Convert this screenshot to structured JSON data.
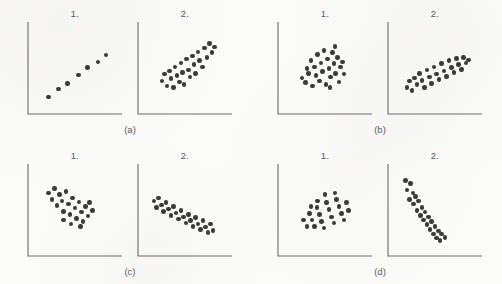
{
  "figure": {
    "type": "scatter-plot-matrix",
    "background_color": "#fbfbfa",
    "dot_color": "#3a3a3a",
    "axis_color": "#6b6b6b",
    "text_color": "#5d5d5d",
    "panel_label_1": "1.",
    "panel_label_2": "2.",
    "captions": {
      "a": "(a)",
      "b": "(b)",
      "c": "(c)",
      "d": "(d)"
    }
  },
  "chart_data": [
    {
      "id": "a1",
      "type": "scatter",
      "title": "1.",
      "group": "(a)",
      "xlabel": "",
      "ylabel": "",
      "xlim": [
        0,
        100
      ],
      "ylim": [
        0,
        100
      ],
      "grid": false,
      "legend": "none",
      "relationship": "strong positive linear",
      "points": [
        [
          18,
          14
        ],
        [
          30,
          24
        ],
        [
          41,
          31
        ],
        [
          54,
          42
        ],
        [
          65,
          51
        ],
        [
          78,
          58
        ],
        [
          88,
          67
        ]
      ]
    },
    {
      "id": "a2",
      "type": "scatter",
      "title": "2.",
      "group": "(a)",
      "xlabel": "",
      "ylabel": "",
      "xlim": [
        0,
        100
      ],
      "ylim": [
        0,
        100
      ],
      "grid": false,
      "legend": "none",
      "relationship": "moderate positive",
      "points": [
        [
          22,
          34
        ],
        [
          25,
          43
        ],
        [
          28,
          28
        ],
        [
          31,
          47
        ],
        [
          33,
          37
        ],
        [
          36,
          26
        ],
        [
          38,
          52
        ],
        [
          40,
          41
        ],
        [
          43,
          33
        ],
        [
          45,
          57
        ],
        [
          47,
          45
        ],
        [
          49,
          30
        ],
        [
          52,
          62
        ],
        [
          54,
          48
        ],
        [
          56,
          39
        ],
        [
          59,
          66
        ],
        [
          61,
          55
        ],
        [
          63,
          44
        ],
        [
          66,
          71
        ],
        [
          68,
          60
        ],
        [
          71,
          52
        ],
        [
          74,
          76
        ],
        [
          77,
          64
        ],
        [
          80,
          82
        ],
        [
          83,
          70
        ],
        [
          86,
          77
        ]
      ]
    },
    {
      "id": "b1",
      "type": "scatter",
      "title": "1.",
      "group": "(b)",
      "xlabel": "",
      "ylabel": "",
      "xlim": [
        0,
        100
      ],
      "ylim": [
        0,
        100
      ],
      "grid": false,
      "legend": "none",
      "relationship": "no correlation (round cloud)",
      "points": [
        [
          22,
          38
        ],
        [
          26,
          32
        ],
        [
          28,
          50
        ],
        [
          30,
          44
        ],
        [
          33,
          60
        ],
        [
          35,
          28
        ],
        [
          37,
          52
        ],
        [
          39,
          41
        ],
        [
          41,
          68
        ],
        [
          43,
          34
        ],
        [
          45,
          57
        ],
        [
          47,
          46
        ],
        [
          49,
          73
        ],
        [
          51,
          30
        ],
        [
          53,
          62
        ],
        [
          55,
          50
        ],
        [
          57,
          39
        ],
        [
          59,
          70
        ],
        [
          61,
          56
        ],
        [
          63,
          44
        ],
        [
          65,
          64
        ],
        [
          67,
          33
        ],
        [
          69,
          52
        ],
        [
          71,
          58
        ],
        [
          73,
          43
        ],
        [
          62,
          78
        ],
        [
          56,
          26
        ]
      ]
    },
    {
      "id": "b2",
      "type": "scatter",
      "title": "2.",
      "group": "(b)",
      "xlabel": "",
      "ylabel": "",
      "xlim": [
        0,
        100
      ],
      "ylim": [
        0,
        100
      ],
      "grid": false,
      "legend": "none",
      "relationship": "moderate-to-strong positive",
      "points": [
        [
          16,
          26
        ],
        [
          19,
          34
        ],
        [
          22,
          22
        ],
        [
          25,
          38
        ],
        [
          28,
          30
        ],
        [
          31,
          44
        ],
        [
          34,
          35
        ],
        [
          37,
          26
        ],
        [
          40,
          48
        ],
        [
          43,
          39
        ],
        [
          46,
          31
        ],
        [
          49,
          52
        ],
        [
          52,
          43
        ],
        [
          55,
          36
        ],
        [
          58,
          56
        ],
        [
          61,
          47
        ],
        [
          64,
          40
        ],
        [
          67,
          60
        ],
        [
          70,
          51
        ],
        [
          73,
          45
        ],
        [
          76,
          63
        ],
        [
          79,
          55
        ],
        [
          82,
          49
        ],
        [
          85,
          64
        ],
        [
          88,
          57
        ],
        [
          91,
          61
        ]
      ]
    },
    {
      "id": "c1",
      "type": "scatter",
      "title": "1.",
      "group": "(c)",
      "xlabel": "",
      "ylabel": "",
      "xlim": [
        0,
        100
      ],
      "ylim": [
        0,
        100
      ],
      "grid": false,
      "legend": "none",
      "relationship": "weak negative cloud, upper-left",
      "points": [
        [
          18,
          72
        ],
        [
          22,
          64
        ],
        [
          25,
          78
        ],
        [
          28,
          56
        ],
        [
          31,
          70
        ],
        [
          34,
          62
        ],
        [
          36,
          49
        ],
        [
          39,
          74
        ],
        [
          42,
          58
        ],
        [
          44,
          45
        ],
        [
          47,
          66
        ],
        [
          50,
          53
        ],
        [
          52,
          40
        ],
        [
          55,
          61
        ],
        [
          58,
          48
        ],
        [
          60,
          36
        ],
        [
          63,
          55
        ],
        [
          66,
          43
        ],
        [
          68,
          60
        ],
        [
          71,
          50
        ],
        [
          45,
          33
        ],
        [
          57,
          30
        ],
        [
          36,
          38
        ]
      ]
    },
    {
      "id": "c2",
      "type": "scatter",
      "title": "2.",
      "group": "(c)",
      "xlabel": "",
      "ylabel": "",
      "xlim": [
        0,
        100
      ],
      "ylim": [
        0,
        100
      ],
      "grid": false,
      "legend": "none",
      "relationship": "moderate negative",
      "points": [
        [
          12,
          62
        ],
        [
          15,
          54
        ],
        [
          18,
          66
        ],
        [
          21,
          57
        ],
        [
          24,
          49
        ],
        [
          27,
          60
        ],
        [
          30,
          52
        ],
        [
          33,
          44
        ],
        [
          36,
          55
        ],
        [
          39,
          47
        ],
        [
          42,
          39
        ],
        [
          45,
          50
        ],
        [
          48,
          42
        ],
        [
          51,
          34
        ],
        [
          54,
          45
        ],
        [
          57,
          37
        ],
        [
          60,
          30
        ],
        [
          63,
          41
        ],
        [
          66,
          33
        ],
        [
          69,
          26
        ],
        [
          72,
          37
        ],
        [
          75,
          29
        ],
        [
          78,
          22
        ],
        [
          81,
          33
        ],
        [
          84,
          25
        ]
      ]
    },
    {
      "id": "d1",
      "type": "scatter",
      "title": "1.",
      "group": "(d)",
      "xlabel": "",
      "ylabel": "",
      "xlim": [
        0,
        100
      ],
      "ylim": [
        0,
        100
      ],
      "grid": false,
      "legend": "none",
      "relationship": "moderate positive, compact cloud",
      "points": [
        [
          24,
          38
        ],
        [
          28,
          30
        ],
        [
          31,
          46
        ],
        [
          34,
          38
        ],
        [
          37,
          30
        ],
        [
          40,
          54
        ],
        [
          43,
          45
        ],
        [
          46,
          36
        ],
        [
          49,
          28
        ],
        [
          52,
          60
        ],
        [
          55,
          51
        ],
        [
          58,
          42
        ],
        [
          61,
          34
        ],
        [
          64,
          64
        ],
        [
          67,
          55
        ],
        [
          70,
          46
        ],
        [
          73,
          38
        ],
        [
          76,
          60
        ],
        [
          79,
          50
        ],
        [
          50,
          70
        ],
        [
          62,
          72
        ],
        [
          41,
          62
        ],
        [
          33,
          55
        ]
      ]
    },
    {
      "id": "d2",
      "type": "scatter",
      "title": "2.",
      "group": "(d)",
      "xlabel": "",
      "ylabel": "",
      "xlim": [
        0,
        100
      ],
      "ylim": [
        0,
        100
      ],
      "grid": false,
      "legend": "none",
      "relationship": "strong steep negative",
      "points": [
        [
          14,
          88
        ],
        [
          20,
          84
        ],
        [
          16,
          76
        ],
        [
          23,
          72
        ],
        [
          19,
          64
        ],
        [
          26,
          68
        ],
        [
          24,
          58
        ],
        [
          30,
          62
        ],
        [
          28,
          50
        ],
        [
          34,
          54
        ],
        [
          32,
          44
        ],
        [
          38,
          48
        ],
        [
          36,
          38
        ],
        [
          42,
          42
        ],
        [
          40,
          32
        ],
        [
          46,
          36
        ],
        [
          44,
          26
        ],
        [
          50,
          30
        ],
        [
          48,
          20
        ],
        [
          54,
          24
        ],
        [
          52,
          15
        ],
        [
          58,
          20
        ],
        [
          56,
          12
        ],
        [
          62,
          16
        ]
      ]
    }
  ]
}
